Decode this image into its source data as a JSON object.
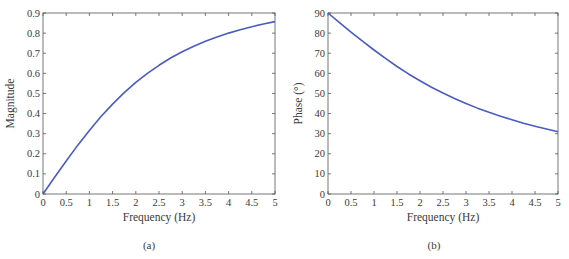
{
  "colors": {
    "curve": "#4a5cc0",
    "axis": "#555555",
    "text": "#3a3a3a"
  },
  "chart_data": [
    {
      "type": "line",
      "panel_label": "(a)",
      "title": "",
      "xlabel": "Frequency (Hz)",
      "ylabel": "Magnitude",
      "xlim": [
        0,
        5
      ],
      "ylim": [
        0,
        0.9
      ],
      "xticks": [
        "0",
        "0.5",
        "1",
        "1.5",
        "2",
        "2.5",
        "3",
        "3.5",
        "4",
        "4.5",
        "5"
      ],
      "yticks": [
        "0",
        "0.1",
        "0.2",
        "0.3",
        "0.4",
        "0.5",
        "0.6",
        "0.7",
        "0.8",
        "0.9"
      ],
      "grid": false,
      "series": [
        {
          "name": "Magnitude",
          "x": [
            0,
            0.25,
            0.5,
            0.75,
            1,
            1.25,
            1.5,
            1.75,
            2,
            2.25,
            2.5,
            2.75,
            3,
            3.25,
            3.5,
            3.75,
            4,
            4.25,
            4.5,
            4.75,
            5
          ],
          "values": [
            0,
            0.083,
            0.164,
            0.243,
            0.316,
            0.385,
            0.447,
            0.504,
            0.555,
            0.6,
            0.64,
            0.676,
            0.707,
            0.735,
            0.759,
            0.781,
            0.8,
            0.817,
            0.832,
            0.845,
            0.857
          ]
        }
      ]
    },
    {
      "type": "line",
      "panel_label": "(b)",
      "title": "",
      "xlabel": "Frequency (Hz)",
      "ylabel": "Phase (°)",
      "xlim": [
        0,
        5
      ],
      "ylim": [
        0,
        90
      ],
      "xticks": [
        "0",
        "0.5",
        "1",
        "1.5",
        "2",
        "2.5",
        "3",
        "3.5",
        "4",
        "4.5",
        "5"
      ],
      "yticks": [
        "0",
        "10",
        "20",
        "30",
        "40",
        "50",
        "60",
        "70",
        "80",
        "90"
      ],
      "grid": false,
      "series": [
        {
          "name": "Phase",
          "x": [
            0,
            0.25,
            0.5,
            0.75,
            1,
            1.25,
            1.5,
            1.75,
            2,
            2.25,
            2.5,
            2.75,
            3,
            3.25,
            3.5,
            3.75,
            4,
            4.25,
            4.5,
            4.75,
            5
          ],
          "values": [
            90,
            85.2,
            80.5,
            76,
            71.6,
            67.4,
            63.4,
            59.7,
            56.3,
            53.1,
            50.2,
            47.5,
            45,
            42.7,
            40.6,
            38.7,
            36.9,
            35.2,
            33.7,
            32.3,
            31
          ]
        }
      ]
    }
  ]
}
